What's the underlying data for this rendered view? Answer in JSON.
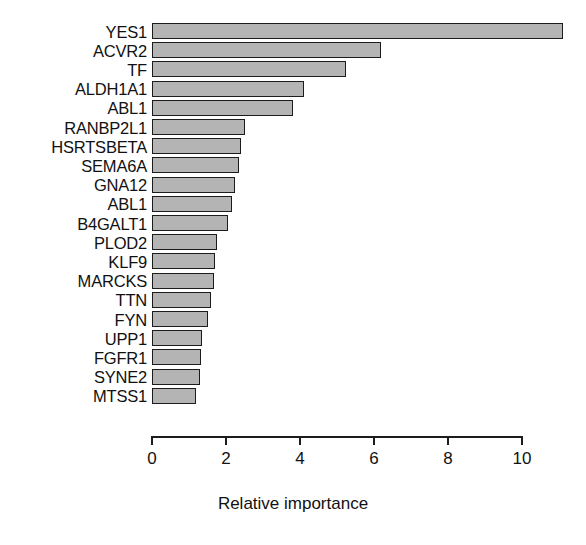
{
  "chart_data": {
    "type": "bar",
    "orientation": "horizontal",
    "title": "",
    "subtitle": "",
    "xlabel": "Relative importance",
    "ylabel": "",
    "xlim": [
      0,
      11.6
    ],
    "ylim": null,
    "grid": false,
    "legend": null,
    "legend_position": "none",
    "xticks": [
      0,
      2,
      4,
      6,
      8,
      10
    ],
    "xtick_labels": [
      "0",
      "2",
      "4",
      "6",
      "8",
      "10"
    ],
    "categories": [
      "YES1",
      "ACVR2",
      "TF",
      "ALDH1A1",
      "ABL1",
      "RANBP2L1",
      "HSRTSBETA",
      "SEMA6A",
      "GNA12",
      "ABL1",
      "B4GALT1",
      "PLOD2",
      "KLF9",
      "MARCKS",
      "TTN",
      "FYN",
      "UPP1",
      "FGFR1",
      "SYNE2",
      "MTSS1"
    ],
    "values": [
      11.1,
      6.2,
      5.25,
      4.1,
      3.8,
      2.5,
      2.4,
      2.35,
      2.25,
      2.15,
      2.05,
      1.75,
      1.7,
      1.68,
      1.6,
      1.5,
      1.35,
      1.33,
      1.3,
      1.2
    ],
    "colors": {
      "bar_fill": "#b4b4b4",
      "bar_border": "#1c1c1c",
      "axis": "#1c1c1c",
      "text": "#111111",
      "background": "#ffffff"
    }
  }
}
